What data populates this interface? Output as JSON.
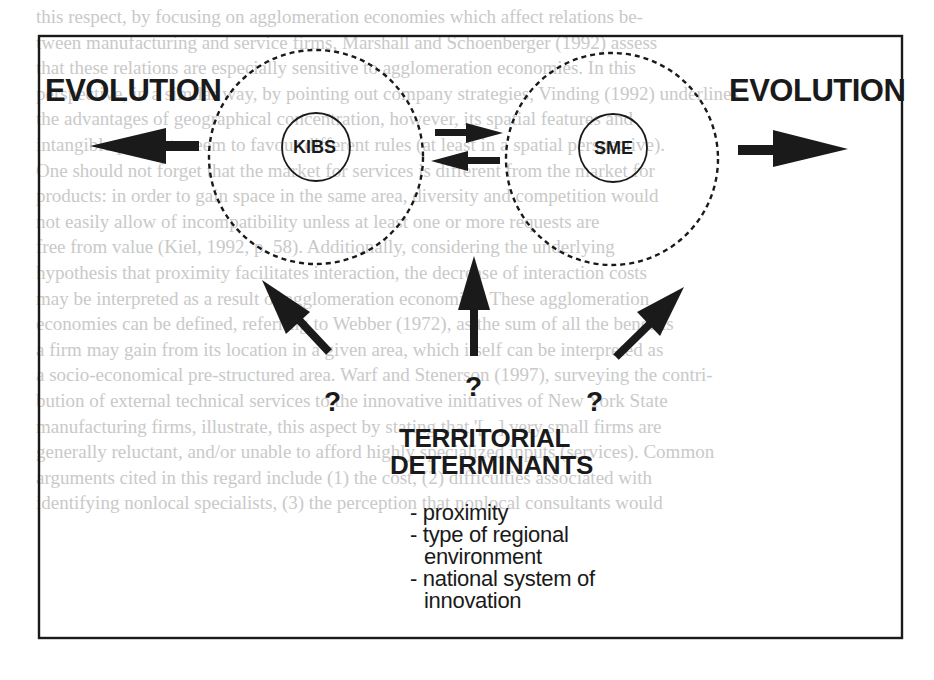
{
  "diagram": {
    "left_label": "EVOLUTION",
    "right_label": "EVOLUTION",
    "nodes": [
      {
        "id": "kibs",
        "label": "KIBS"
      },
      {
        "id": "sme",
        "label": "SME"
      }
    ],
    "question_marks": [
      "?",
      "?",
      "?"
    ],
    "territorial": {
      "title_line1": "TERRITORIAL",
      "title_line2": "DETERMINANTS",
      "items": [
        {
          "line1": "- proximity"
        },
        {
          "line1": "- type of regional",
          "line2": "environment"
        },
        {
          "line1": "- national system of",
          "line2": "innovation"
        }
      ]
    },
    "colors": {
      "ink": "#1a1a1a",
      "bleed_text": "#c9c9c9",
      "background": "#ffffff"
    }
  },
  "background_text": [
    "this respect, by focusing on agglomeration economies which affect relations be-",
    "tween manufacturing and service firms, Marshall and Schoenberger (1992) assess",
    "that these relations are especially sensitive to agglomeration economies. In this",
    "perspective, in a similar way, by pointing out company strategies, Vinding (1992) underlines",
    "the advantages of geographical concentration, however, its spatial features and",
    "intangible products seem to favour different rules (at least in a spatial perspective).",
    "One should not forget that the market for services is different from the market for",
    "products: in order to gain space in the same area, diversity and competition would",
    "not easily allow of incompatibility unless at least one or more requests are",
    "free from value (Kiel, 1992, p. 58). Additionally, considering the underlying",
    "hypothesis that proximity facilitates interaction, the decrease of interaction costs",
    "may be interpreted as a result of agglomeration economies. These agglomeration",
    "economies can be defined, referring to Webber (1972), as the sum of all the benefits",
    "a firm may gain from its location in a given area, which itself can be interpreted as",
    "a socio-economical pre-structured area. Warf and Stenerson (1997), surveying the contri-",
    "bution of external technical services to the innovative initiatives of New York State",
    "manufacturing firms, illustrate, this aspect by stating that '[...] very small firms are",
    "generally reluctant, and/or unable to afford highly specialized inputs (services). Common",
    "arguments cited in this regard include (1) the cost, (2) difficulties associated with",
    "identifying nonlocal specialists, (3) the perception that nonlocal consultants would"
  ]
}
